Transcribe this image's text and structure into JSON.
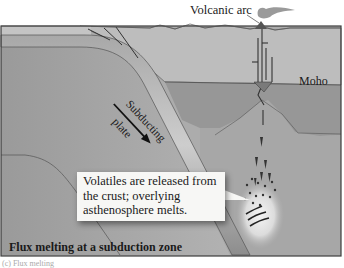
{
  "figure": {
    "title": "Flux melting at a subduction zone",
    "figure_id_partial": "(c) Flux melting",
    "labels": {
      "volcanic_arc": "Volcanic arc",
      "moho": "Moho",
      "subducting_line1": "Subducting",
      "subducting_line2": "plate"
    },
    "callout": "Volatiles are released from the crust; overlying asthenosphere melts.",
    "colors": {
      "ocean_top": "#b9b9b9",
      "crust": "#b5b5b5",
      "mantle_lithosphere": "#979797",
      "asthenosphere": "#a9a9a9",
      "slab": "#8a8a8a",
      "slab_highlight": "#c9c9c9",
      "magma": "#3a3a3a",
      "callout_bg": "#f7f7f5",
      "border": "#3c3c3c"
    }
  }
}
